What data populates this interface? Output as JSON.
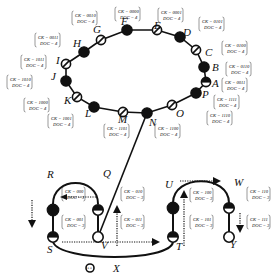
{
  "diagram": {
    "ring": {
      "nodes": [
        {
          "id": "A",
          "style": "half",
          "x": 206,
          "y": 82,
          "lx": 212,
          "ly": 87,
          "ck": "0011",
          "doc": "4",
          "ax": 222,
          "ay": 78
        },
        {
          "id": "B",
          "style": "filled",
          "x": 204,
          "y": 67,
          "lx": 212,
          "ly": 71,
          "ck": "0110",
          "doc": "4",
          "ax": 226,
          "ay": 62
        },
        {
          "id": "C",
          "style": "slash",
          "x": 196,
          "y": 50,
          "lx": 205,
          "ly": 56,
          "ck": "0100",
          "doc": "4",
          "ax": 222,
          "ay": 41
        },
        {
          "id": "D",
          "style": "filled",
          "x": 180,
          "y": 37,
          "lx": 183,
          "ly": 36,
          "ck": "0101",
          "doc": "4",
          "ax": 199,
          "ay": 17
        },
        {
          "id": "E",
          "style": "slash",
          "x": 157,
          "y": 30,
          "lx": 154,
          "ly": 29,
          "ck": "0001",
          "doc": "4",
          "ax": 158,
          "ay": 8
        },
        {
          "id": "F",
          "style": "filled",
          "x": 127,
          "y": 30,
          "lx": 121,
          "ly": 25,
          "ck": "0000",
          "doc": "4",
          "ax": 115,
          "ay": 7
        },
        {
          "id": "G",
          "style": "slash",
          "x": 101,
          "y": 40,
          "lx": 93,
          "ly": 33,
          "ck": "0010",
          "doc": "4",
          "ax": 72,
          "ay": 11
        },
        {
          "id": "H",
          "style": "filled",
          "x": 84,
          "y": 52,
          "lx": 73,
          "ly": 47,
          "ck": "0011",
          "doc": "4",
          "ax": 35,
          "ay": 33
        },
        {
          "id": "I",
          "style": "slash",
          "x": 66,
          "y": 64,
          "lx": 56,
          "ly": 64,
          "ck": "1011",
          "doc": "4",
          "ax": 21,
          "ay": 55
        },
        {
          "id": "J",
          "style": "filled",
          "x": 66,
          "y": 81,
          "lx": 51,
          "ly": 80,
          "ck": "1010",
          "doc": "4",
          "ax": 7,
          "ay": 75
        },
        {
          "id": "K",
          "style": "slash",
          "x": 77,
          "y": 97,
          "lx": 64,
          "ly": 104,
          "ck": "1000",
          "doc": "4",
          "ax": 24,
          "ay": 98
        },
        {
          "id": "L",
          "style": "filled",
          "x": 94,
          "y": 107,
          "lx": 85,
          "ly": 117,
          "ck": "1001",
          "doc": "4",
          "ax": 48,
          "ay": 114
        },
        {
          "id": "M",
          "style": "slash",
          "x": 123,
          "y": 112,
          "lx": 118,
          "ly": 123,
          "ck": "1101",
          "doc": "4",
          "ax": 104,
          "ay": 124
        },
        {
          "id": "N",
          "style": "filled",
          "x": 147,
          "y": 113,
          "lx": 149,
          "ly": 126,
          "ck": "1100",
          "doc": "4",
          "ax": 155,
          "ay": 124
        },
        {
          "id": "O",
          "style": "slash",
          "x": 172,
          "y": 105,
          "lx": 176,
          "ly": 117,
          "ck": "1110",
          "doc": "4",
          "ax": 207,
          "ay": 111
        },
        {
          "id": "P",
          "style": "filled",
          "x": 196,
          "y": 93,
          "lx": 202,
          "ly": 98,
          "ck": "1111",
          "doc": "4",
          "ax": 214,
          "ay": 95
        }
      ],
      "annotation_template": {
        "ck_prefix": "CK = ",
        "doc_prefix": "DOC = "
      }
    },
    "cube": {
      "nodes": [
        {
          "id": "R",
          "style": "filled",
          "x": 53,
          "y": 210,
          "lx": 47,
          "ly": 178,
          "ck": "000",
          "doc": "3",
          "ax": 62,
          "ay": 187
        },
        {
          "id": "Q",
          "style": "half",
          "x": 98,
          "y": 210,
          "lx": 103,
          "ly": 177,
          "ck": "010",
          "doc": "3",
          "ax": 121,
          "ay": 187
        },
        {
          "id": "S",
          "style": "half",
          "x": 53,
          "y": 237,
          "lx": 47,
          "ly": 253,
          "ck": "001",
          "doc": "3",
          "ax": 62,
          "ay": 215
        },
        {
          "id": "V",
          "style": "open",
          "x": 98,
          "y": 237,
          "lx": 101,
          "ly": 249,
          "ck": "011",
          "doc": "3",
          "ax": 121,
          "ay": 215
        },
        {
          "id": "U",
          "style": "filled",
          "x": 173,
          "y": 208,
          "lx": 165,
          "ly": 188,
          "ck": "100",
          "doc": "3",
          "ax": 190,
          "ay": 188
        },
        {
          "id": "W",
          "style": "half",
          "x": 229,
          "y": 208,
          "lx": 234,
          "ly": 186,
          "ck": "110",
          "doc": "3",
          "ax": 247,
          "ay": 187
        },
        {
          "id": "T",
          "style": "half",
          "x": 173,
          "y": 237,
          "lx": 176,
          "ly": 250,
          "ck": "101",
          "doc": "3",
          "ax": 190,
          "ay": 215
        },
        {
          "id": "Y",
          "style": "open",
          "x": 229,
          "y": 237,
          "lx": 230,
          "ly": 248,
          "ck": "111",
          "doc": "3",
          "ax": 247,
          "ay": 215
        }
      ]
    },
    "isolated": {
      "id": "X",
      "x": 90,
      "y": 268,
      "lx": 113,
      "ly": 272,
      "inner_text": "ε.ε"
    }
  }
}
